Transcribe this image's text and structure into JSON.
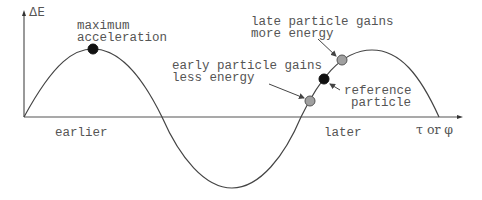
{
  "diagram": {
    "type": "rf-bucket-phase-stability",
    "y_axis_label": "ΔE",
    "x_axis_label": "τ or φ",
    "x_region_labels": {
      "left": "earlier",
      "right": "later"
    },
    "annotations": {
      "max_accel": {
        "line1": "maximum",
        "line2": "acceleration"
      },
      "early": {
        "line1": "early particle gains",
        "line2": "less energy"
      },
      "late": {
        "line1": "late particle gains",
        "line2": "more energy"
      },
      "reference": {
        "line1": "reference",
        "line2": "particle"
      }
    },
    "markers": [
      {
        "name": "maximum-acceleration-point",
        "x": 93,
        "y": 49,
        "fill": "#111111"
      },
      {
        "name": "early-particle-point",
        "x": 310,
        "y": 101,
        "fill": "#a0a0a0"
      },
      {
        "name": "reference-particle-point",
        "x": 324,
        "y": 79,
        "fill": "#111111"
      },
      {
        "name": "late-particle-point",
        "x": 342,
        "y": 60,
        "fill": "#a0a0a0"
      }
    ],
    "colors": {
      "curve": "#444444",
      "axis": "#555555",
      "text": "#555555",
      "dot_dark": "#111111",
      "dot_gray": "#a0a0a0"
    }
  }
}
